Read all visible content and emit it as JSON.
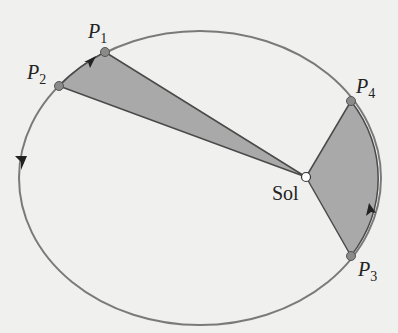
{
  "diagram": {
    "colors": {
      "background": "#f0f0ee",
      "orbit": "#7a7a7a",
      "sector_fill": "#a9a9a9",
      "sector_stroke": "#5a5a5a",
      "point_fill": "#8a8a8a",
      "sun_fill": "#ffffff",
      "arrow": "#222222"
    },
    "orbit": {
      "cx": 200,
      "cy": 178,
      "rx": 181,
      "ry": 147
    },
    "sun": {
      "label": "Sol",
      "x": 306,
      "y": 177
    },
    "points": [
      {
        "name": "P",
        "sub": "1",
        "x": 105,
        "y": 52
      },
      {
        "name": "P",
        "sub": "2",
        "x": 59,
        "y": 86
      },
      {
        "name": "P",
        "sub": "3",
        "x": 351,
        "y": 256
      },
      {
        "name": "P",
        "sub": "4",
        "x": 351,
        "y": 101
      }
    ],
    "sectors": [
      {
        "from": "P1",
        "to": "P2",
        "label": "sector-near-aphelion"
      },
      {
        "from": "P3",
        "to": "P4",
        "label": "sector-near-perihelion"
      }
    ],
    "arrows": [
      "counterclockwise-top-left",
      "counterclockwise-left",
      "counterclockwise-right"
    ]
  }
}
